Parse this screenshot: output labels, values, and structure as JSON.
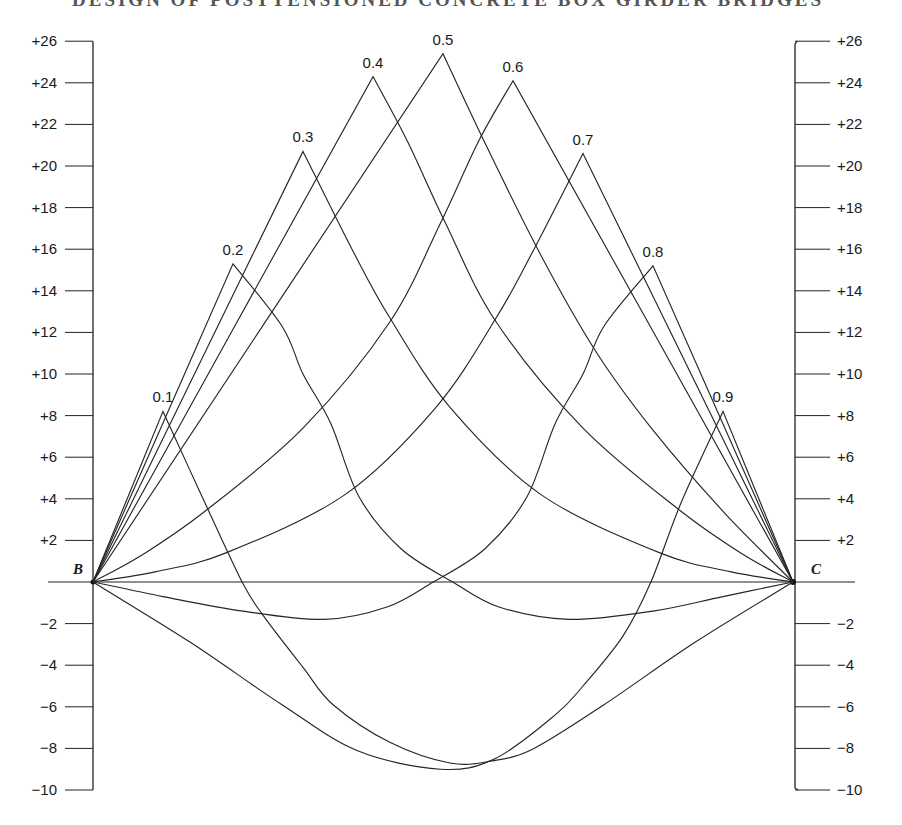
{
  "header": {
    "page_number": "",
    "running_title": "DESIGN OF POSTTENSIONED CONCRETE BOX GIRDER BRIDGES"
  },
  "chart_data": {
    "type": "line",
    "title": "",
    "xlabel": "",
    "ylabel": "",
    "x_range": [
      0,
      1
    ],
    "ylim": [
      -10,
      26
    ],
    "grid": false,
    "support_labels": {
      "left": "B",
      "right": "C"
    },
    "left_axis_ticks": [
      {
        "value": 26,
        "label": "+26"
      },
      {
        "value": 24,
        "label": "+24"
      },
      {
        "value": 22,
        "label": "+22"
      },
      {
        "value": 20,
        "label": "+20"
      },
      {
        "value": 18,
        "label": "+18"
      },
      {
        "value": 16,
        "label": "+16"
      },
      {
        "value": 14,
        "label": "+14"
      },
      {
        "value": 12,
        "label": "+12"
      },
      {
        "value": 10,
        "label": "+10"
      },
      {
        "value": 8,
        "label": "+8"
      },
      {
        "value": 6,
        "label": "+6"
      },
      {
        "value": 4,
        "label": "+4"
      },
      {
        "value": 2,
        "label": "+2"
      },
      {
        "value": -2,
        "label": "−2"
      },
      {
        "value": -4,
        "label": "−4"
      },
      {
        "value": -6,
        "label": "−6"
      },
      {
        "value": -8,
        "label": "−8"
      },
      {
        "value": -10,
        "label": "−10"
      }
    ],
    "right_axis_ticks": [
      {
        "value": 26,
        "label": "+26"
      },
      {
        "value": 24,
        "label": "+24"
      },
      {
        "value": 22,
        "label": "+22"
      },
      {
        "value": 20,
        "label": "+20"
      },
      {
        "value": 18,
        "label": "+18"
      },
      {
        "value": 16,
        "label": "+16"
      },
      {
        "value": 14,
        "label": "+14"
      },
      {
        "value": 12,
        "label": "+12"
      },
      {
        "value": 10,
        "label": "+10"
      },
      {
        "value": 8,
        "label": "+8"
      },
      {
        "value": 6,
        "label": "+6"
      },
      {
        "value": 4,
        "label": "+4"
      },
      {
        "value": 2,
        "label": "+2"
      },
      {
        "value": -2,
        "label": "−2"
      },
      {
        "value": -4,
        "label": "−4"
      },
      {
        "value": -6,
        "label": "−6"
      },
      {
        "value": -8,
        "label": "−8"
      },
      {
        "value": -10,
        "label": "−10"
      }
    ],
    "series": [
      {
        "name": "0.1",
        "peak": [
          0.1,
          8.2
        ],
        "points": [
          [
            0,
            0
          ],
          [
            0.1,
            8.2
          ],
          [
            0.16,
            3.8
          ],
          [
            0.213,
            0
          ],
          [
            0.243,
            -1.6
          ],
          [
            0.3,
            -4.1
          ],
          [
            0.343,
            -5.9
          ],
          [
            0.424,
            -7.7
          ],
          [
            0.51,
            -8.7
          ],
          [
            0.57,
            -8.6
          ],
          [
            0.63,
            -8.0
          ],
          [
            0.73,
            -5.9
          ],
          [
            0.86,
            -2.9
          ],
          [
            1.0,
            0
          ]
        ]
      },
      {
        "name": "0.2",
        "peak": [
          0.2,
          15.3
        ],
        "points": [
          [
            0,
            0
          ],
          [
            0.2,
            15.3
          ],
          [
            0.27,
            12.3
          ],
          [
            0.3,
            10.0
          ],
          [
            0.34,
            7.6
          ],
          [
            0.38,
            4.1
          ],
          [
            0.44,
            1.6
          ],
          [
            0.514,
            0
          ],
          [
            0.58,
            -1.2
          ],
          [
            0.68,
            -1.8
          ],
          [
            0.8,
            -1.4
          ],
          [
            0.9,
            -0.7
          ],
          [
            1.0,
            0
          ]
        ]
      },
      {
        "name": "0.3",
        "peak": [
          0.3,
          20.7
        ],
        "points": [
          [
            0,
            0
          ],
          [
            0.3,
            20.7
          ],
          [
            0.37,
            16.0
          ],
          [
            0.424,
            12.7
          ],
          [
            0.51,
            8.4
          ],
          [
            0.64,
            4.2
          ],
          [
            0.81,
            1.4
          ],
          [
            0.91,
            0.5
          ],
          [
            1.0,
            0
          ]
        ]
      },
      {
        "name": "0.4",
        "peak": [
          0.4,
          24.3
        ],
        "points": [
          [
            0,
            0
          ],
          [
            0.4,
            24.3
          ],
          [
            0.449,
            21.2
          ],
          [
            0.503,
            17.3
          ],
          [
            0.576,
            12.5
          ],
          [
            0.7,
            7.4
          ],
          [
            0.84,
            3.4
          ],
          [
            0.93,
            1.3
          ],
          [
            1.0,
            0
          ]
        ]
      },
      {
        "name": "0.5",
        "peak": [
          0.5,
          25.4
        ],
        "points": [
          [
            0,
            0
          ],
          [
            0.5,
            25.4
          ],
          [
            0.56,
            21.1
          ],
          [
            0.64,
            15.7
          ],
          [
            0.72,
            11.0
          ],
          [
            0.8,
            7.3
          ],
          [
            0.9,
            3.4
          ],
          [
            1.0,
            0
          ]
        ]
      },
      {
        "name": "0.6",
        "peak": [
          0.6,
          24.1
        ],
        "points": [
          [
            0,
            0
          ],
          [
            0.07,
            1.3
          ],
          [
            0.16,
            3.4
          ],
          [
            0.3,
            7.4
          ],
          [
            0.424,
            12.5
          ],
          [
            0.497,
            17.3
          ],
          [
            0.551,
            21.2
          ],
          [
            0.6,
            24.1
          ],
          [
            1.0,
            0
          ]
        ]
      },
      {
        "name": "0.7",
        "peak": [
          0.7,
          20.6
        ],
        "points": [
          [
            0,
            0
          ],
          [
            0.09,
            0.5
          ],
          [
            0.19,
            1.4
          ],
          [
            0.36,
            4.2
          ],
          [
            0.49,
            8.4
          ],
          [
            0.576,
            12.7
          ],
          [
            0.63,
            16.0
          ],
          [
            0.7,
            20.6
          ],
          [
            1.0,
            0
          ]
        ]
      },
      {
        "name": "0.8",
        "peak": [
          0.8,
          15.2
        ],
        "points": [
          [
            0,
            0
          ],
          [
            0.1,
            -0.7
          ],
          [
            0.214,
            -1.4
          ],
          [
            0.33,
            -1.8
          ],
          [
            0.42,
            -1.2
          ],
          [
            0.486,
            0
          ],
          [
            0.56,
            1.6
          ],
          [
            0.62,
            4.1
          ],
          [
            0.66,
            7.6
          ],
          [
            0.7,
            10.0
          ],
          [
            0.73,
            12.3
          ],
          [
            0.8,
            15.2
          ],
          [
            1.0,
            0
          ]
        ]
      },
      {
        "name": "0.9",
        "peak": [
          0.9,
          8.2
        ],
        "points": [
          [
            0,
            0
          ],
          [
            0.139,
            -2.9
          ],
          [
            0.27,
            -5.9
          ],
          [
            0.377,
            -8.1
          ],
          [
            0.496,
            -9.0
          ],
          [
            0.574,
            -8.5
          ],
          [
            0.66,
            -6.4
          ],
          [
            0.7,
            -5.0
          ],
          [
            0.757,
            -2.6
          ],
          [
            0.797,
            0
          ],
          [
            0.84,
            3.8
          ],
          [
            0.9,
            8.2
          ],
          [
            1.0,
            0
          ]
        ]
      }
    ]
  }
}
